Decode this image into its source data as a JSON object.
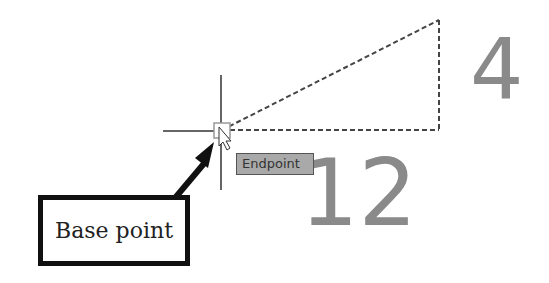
{
  "labels": {
    "side_top": "4",
    "side_bottom": "12",
    "tooltip": "Endpoint",
    "callout": "Base point"
  },
  "colors": {
    "tooltip_bg": "#a9a9a9",
    "number_fill": "#8a8a8a",
    "line": "#444444"
  }
}
